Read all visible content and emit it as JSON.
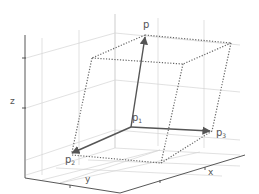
{
  "diagram": {
    "type": "3d-parallelepiped",
    "axes": {
      "x": "x",
      "y": "y",
      "z": "z"
    },
    "points": {
      "p": {
        "base": "p",
        "sub": ""
      },
      "p1": {
        "base": "p",
        "sub": "1"
      },
      "p2": {
        "base": "p",
        "sub": "2"
      },
      "p3": {
        "base": "p",
        "sub": "3"
      }
    },
    "vectors": [
      "p1→p",
      "p1→p2",
      "p1→p3"
    ],
    "edge_style": "dotted",
    "colors": {
      "vector": "#555555",
      "edges": "#666666",
      "grid": "#d0d0d0",
      "axis": "#444444"
    }
  }
}
